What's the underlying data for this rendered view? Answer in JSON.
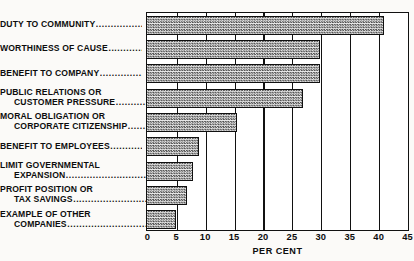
{
  "chart_data": {
    "type": "bar",
    "orientation": "horizontal",
    "title": "",
    "xlabel": "PER CENT",
    "ylabel": "",
    "xlim": [
      0,
      45
    ],
    "xticks": [
      0,
      5,
      10,
      15,
      20,
      25,
      30,
      35,
      40,
      45
    ],
    "tick_labels": [
      "0",
      "5",
      "10",
      "15",
      "20",
      "25",
      "30",
      "35",
      "40",
      "45"
    ],
    "grid": true,
    "grid_axis": "x",
    "legend": null,
    "categories": [
      "DUTY TO COMMUNITY",
      "WORTHINESS OF CAUSE",
      "BENEFIT TO COMPANY",
      "PUBLIC RELATIONS OR CUSTOMER PRESSURE",
      "MORAL OBLIGATION OR CORPORATE CITIZENSHIP",
      "BENEFIT TO EMPLOYEES",
      "LIMIT GOVERNMENTAL EXPANSION",
      "PROFIT POSITION OR TAX SAVINGS",
      "EXAMPLE OF OTHER COMPANIES"
    ],
    "values": [
      41,
      30,
      30,
      27,
      15.5,
      9,
      8,
      7,
      5
    ],
    "colors": {
      "bar_fill": "#9a9a9a",
      "bar_edge": "#101010",
      "frame": "#111111",
      "background": "#fbfaf8"
    }
  },
  "labels": [
    {
      "lines": [
        "DUTY TO COMMUNITY"
      ],
      "leader_on": 0
    },
    {
      "lines": [
        "WORTHINESS OF CAUSE"
      ],
      "leader_on": 0
    },
    {
      "lines": [
        "BENEFIT TO COMPANY"
      ],
      "leader_on": 0
    },
    {
      "lines": [
        "PUBLIC RELATIONS OR",
        "CUSTOMER PRESSURE"
      ],
      "leader_on": 1
    },
    {
      "lines": [
        "MORAL OBLIGATION OR",
        "CORPORATE CITIZENSHIP"
      ],
      "leader_on": 1
    },
    {
      "lines": [
        "BENEFIT TO EMPLOYEES"
      ],
      "leader_on": 0
    },
    {
      "lines": [
        "LIMIT GOVERNMENTAL",
        "EXPANSION"
      ],
      "leader_on": 1
    },
    {
      "lines": [
        "PROFIT POSITION OR",
        "TAX SAVINGS"
      ],
      "leader_on": 1
    },
    {
      "lines": [
        "EXAMPLE OF OTHER",
        "COMPANIES"
      ],
      "leader_on": 1
    }
  ],
  "leader_glyph": "................................................"
}
